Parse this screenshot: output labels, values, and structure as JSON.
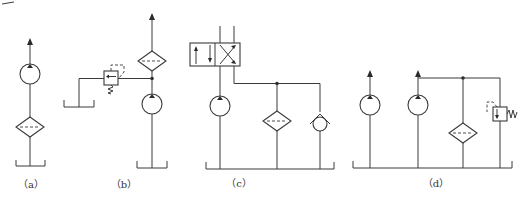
{
  "figure": {
    "type": "hydraulic-circuit-diagrams",
    "panels": [
      {
        "id": "a",
        "label": "（a）",
        "components": [
          "pump",
          "filter",
          "tank"
        ]
      },
      {
        "id": "b",
        "label": "（b）",
        "components": [
          "pump",
          "filter",
          "relief-valve",
          "tank"
        ]
      },
      {
        "id": "c",
        "label": "（c）",
        "components": [
          "directional-valve",
          "pump",
          "filter",
          "check-valve",
          "tank"
        ]
      },
      {
        "id": "d",
        "label": "（d）",
        "components": [
          "pump",
          "pump",
          "filter",
          "relief-valve",
          "tank"
        ]
      }
    ]
  },
  "colors": {
    "line": "#3a3a3a",
    "background": "#ffffff"
  }
}
